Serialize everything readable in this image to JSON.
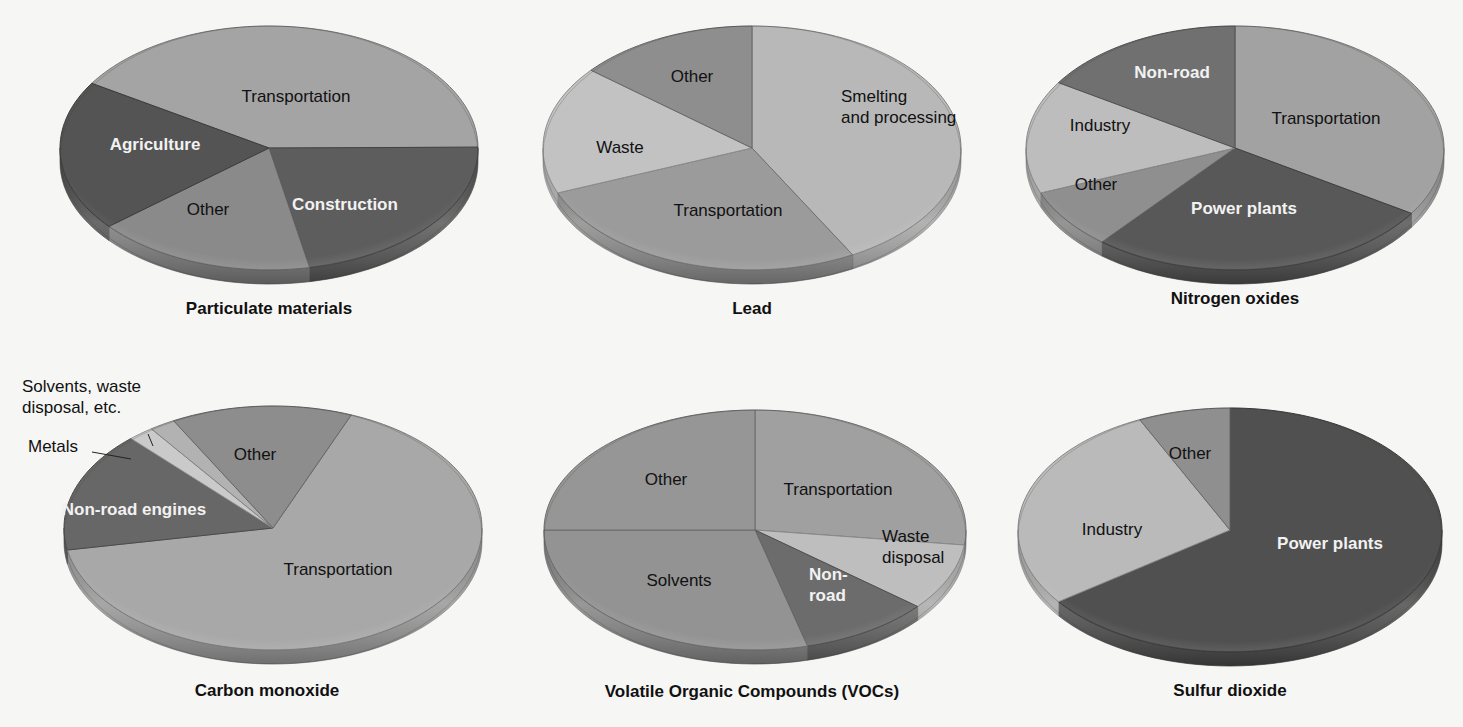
{
  "chart_data": [
    {
      "type": "pie",
      "title": "Particulate materials",
      "center": [
        269,
        148
      ],
      "rx": 209,
      "ry": 122,
      "depth": 14,
      "start_deg": -58,
      "slices": [
        {
          "label": "Transportation",
          "value": 41,
          "color": "#a4a4a4",
          "text_color": "dark",
          "label_pos": [
            296,
            96
          ]
        },
        {
          "label": "Construction",
          "value": 22,
          "color": "#5d5d5d",
          "text_color": "light",
          "label_pos": [
            345,
            204
          ]
        },
        {
          "label": "Other",
          "value": 17,
          "color": "#8a8a8a",
          "text_color": "dark",
          "label_pos": [
            208,
            209
          ]
        },
        {
          "label": "Agriculture",
          "value": 20,
          "color": "#545454",
          "text_color": "light",
          "label_pos": [
            155,
            144
          ]
        }
      ],
      "title_pos": [
        269,
        314
      ]
    },
    {
      "type": "pie",
      "title": "Lead",
      "center": [
        752,
        148
      ],
      "rx": 209,
      "ry": 122,
      "depth": 14,
      "start_deg": 0,
      "slices": [
        {
          "label": "Smelting\nand processing",
          "value": 42,
          "color": "#b8b8b8",
          "text_color": "dark",
          "label_pos": [
            841,
            112
          ]
        },
        {
          "label": "Transportation",
          "value": 27,
          "color": "#9b9b9b",
          "text_color": "dark",
          "label_pos": [
            728,
            210
          ]
        },
        {
          "label": "Waste",
          "value": 17,
          "color": "#c2c2c2",
          "text_color": "dark",
          "label_pos": [
            620,
            147
          ]
        },
        {
          "label": "Other",
          "value": 14,
          "color": "#8e8e8e",
          "text_color": "dark",
          "label_pos": [
            692,
            76
          ]
        }
      ],
      "title_pos": [
        752,
        314
      ]
    },
    {
      "type": "pie",
      "title": "Nitrogen oxides",
      "center": [
        1235,
        148
      ],
      "rx": 209,
      "ry": 122,
      "depth": 14,
      "start_deg": 0,
      "slices": [
        {
          "label": "Transportation",
          "value": 34,
          "color": "#a2a2a2",
          "text_color": "dark",
          "label_pos": [
            1326,
            118
          ]
        },
        {
          "label": "Power plants",
          "value": 27,
          "color": "#585858",
          "text_color": "light",
          "label_pos": [
            1244,
            208
          ]
        },
        {
          "label": "Other",
          "value": 8,
          "color": "#8f8f8f",
          "text_color": "dark",
          "label_pos": [
            1096,
            184
          ]
        },
        {
          "label": "Industry",
          "value": 15,
          "color": "#bdbdbd",
          "text_color": "dark",
          "label_pos": [
            1100,
            125
          ]
        },
        {
          "label": "Non-road",
          "value": 16,
          "color": "#707070",
          "text_color": "light",
          "label_pos": [
            1172,
            72
          ]
        }
      ],
      "title_pos": [
        1235,
        304
      ]
    },
    {
      "type": "pie",
      "title": "Carbon monoxide",
      "center": [
        273,
        528
      ],
      "rx": 209,
      "ry": 122,
      "depth": 14,
      "start_deg": 22,
      "slices": [
        {
          "label": "Transportation",
          "value": 66,
          "color": "#a8a8a8",
          "text_color": "dark",
          "label_pos": [
            338,
            569
          ]
        },
        {
          "label": "Non-road engines",
          "value": 16,
          "color": "#676767",
          "text_color": "light",
          "label_pos": [
            134,
            509
          ]
        },
        {
          "label": "Metals",
          "value": 2,
          "color": "#cacaca",
          "text_color": "dark",
          "label_pos": null
        },
        {
          "label": "Solvents, waste disposal, etc.",
          "value": 2,
          "color": "#b2b2b2",
          "text_color": "dark",
          "label_pos": null
        },
        {
          "label": "Other",
          "value": 14,
          "color": "#8d8d8d",
          "text_color": "dark",
          "label_pos": [
            255,
            454
          ]
        }
      ],
      "callouts": [
        {
          "label": "Solvents, waste\ndisposal, etc.",
          "text_pos": [
            22,
            392
          ],
          "line": [
            [
              148,
              434
            ],
            [
              153,
              446
            ]
          ]
        },
        {
          "label": "Metals",
          "text_pos": [
            28,
            452
          ],
          "line": [
            [
              92,
              452
            ],
            [
              131,
              459
            ]
          ]
        }
      ],
      "title_pos": [
        267,
        696
      ]
    },
    {
      "type": "pie",
      "title": "Volatile Organic Compounds (VOCs)",
      "center": [
        755,
        530
      ],
      "rx": 211,
      "ry": 120,
      "depth": 14,
      "start_deg": 0,
      "slices": [
        {
          "label": "Transportation",
          "value": 27,
          "color": "#a0a0a0",
          "text_color": "dark",
          "label_pos": [
            838,
            489
          ]
        },
        {
          "label": "Waste\ndisposal",
          "value": 9,
          "color": "#bebebe",
          "text_color": "dark",
          "label_pos": [
            882,
            552
          ]
        },
        {
          "label": "Non-\nroad",
          "value": 10,
          "color": "#6c6c6c",
          "text_color": "light",
          "label_pos": [
            809,
            590
          ]
        },
        {
          "label": "Solvents",
          "value": 29,
          "color": "#939393",
          "text_color": "dark",
          "label_pos": [
            679,
            580
          ]
        },
        {
          "label": "Other",
          "value": 25,
          "color": "#969696",
          "text_color": "dark",
          "label_pos": [
            666,
            479
          ]
        }
      ],
      "title_pos": [
        752,
        697
      ]
    },
    {
      "type": "pie",
      "title": "Sulfur dioxide",
      "center": [
        1230,
        530
      ],
      "rx": 212,
      "ry": 122,
      "depth": 14,
      "start_deg": 0,
      "slices": [
        {
          "label": "Power plants",
          "value": 65,
          "color": "#505050",
          "text_color": "light",
          "label_pos": [
            1330,
            543
          ]
        },
        {
          "label": "Industry",
          "value": 28,
          "color": "#bababa",
          "text_color": "dark",
          "label_pos": [
            1112,
            529
          ]
        },
        {
          "label": "Other",
          "value": 7,
          "color": "#8f8f8f",
          "text_color": "dark",
          "label_pos": [
            1190,
            453
          ]
        }
      ],
      "title_pos": [
        1230,
        696
      ]
    }
  ]
}
